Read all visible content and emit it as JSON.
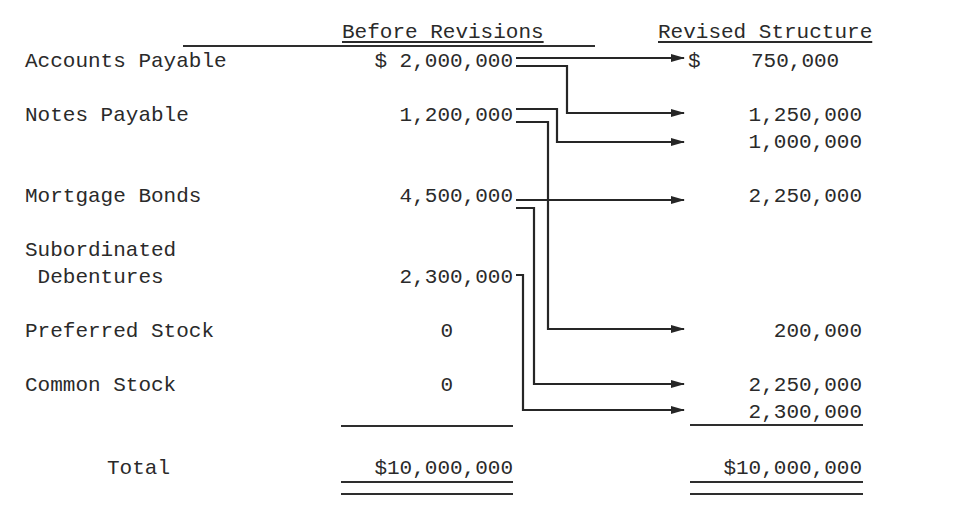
{
  "headers": {
    "before": "Before Revisions",
    "revised": "Revised Structure"
  },
  "rows": [
    {
      "label": "Accounts Payable",
      "before": "$ 2,000,000"
    },
    {
      "label": "Notes Payable",
      "before": "1,200,000"
    },
    {
      "label": "Mortgage Bonds",
      "before": "4,500,000"
    },
    {
      "label_line1": "Subordinated",
      "label_line2": " Debentures",
      "before": "2,300,000"
    },
    {
      "label": "Preferred Stock",
      "before": "0"
    },
    {
      "label": "Common Stock",
      "before": "0"
    }
  ],
  "revised_values": [
    {
      "value": "$    750,000",
      "source": "Accounts Payable"
    },
    {
      "value": "1,250,000",
      "source": "Accounts Payable"
    },
    {
      "value": "1,000,000",
      "source": "Notes Payable"
    },
    {
      "value": "2,250,000",
      "source": "Mortgage Bonds"
    },
    {
      "value": "200,000",
      "source": "Notes Payable"
    },
    {
      "value": "2,250,000",
      "source": "Mortgage Bonds"
    },
    {
      "value": "2,300,000",
      "source": "Subordinated Debentures"
    }
  ],
  "total": {
    "label": "Total",
    "before": "$10,000,000",
    "revised": "$10,000,000"
  },
  "colors": {
    "ink": "#2a2a2a",
    "background": "#ffffff"
  }
}
